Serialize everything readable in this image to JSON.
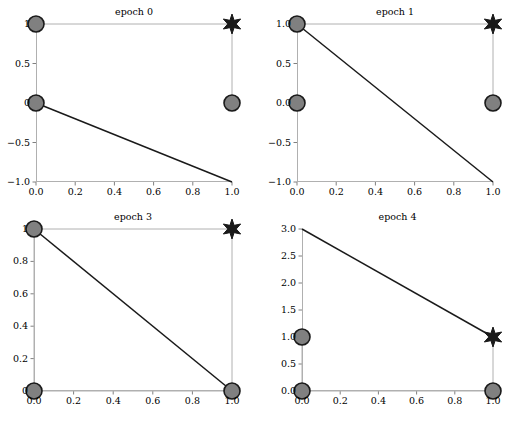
{
  "figure": {
    "width": 522,
    "height": 423,
    "background": "#ffffff",
    "rows": 2,
    "cols": 2
  },
  "style": {
    "marker_face_color": "#808080",
    "marker_edge_color": "#1a1a1a",
    "star_color": "#1a1a1a",
    "boundary_line_color": "#1a1a1a",
    "connector_line_color": "#b0b0b0",
    "axis_color": "#b0b0b0",
    "tick_color": "#808080",
    "text_color": "#000000"
  },
  "chart_data": [
    {
      "type": "scatter",
      "title": "epoch 0",
      "xlabel": "",
      "ylabel": "",
      "xlim": [
        0.0,
        1.0
      ],
      "ylim": [
        -1.0,
        1.0
      ],
      "grid": false,
      "legend": "none",
      "xticks": [
        "0.0",
        "0.2",
        "0.4",
        "0.6",
        "0.8",
        "1.0"
      ],
      "xtick_values": [
        0.0,
        0.2,
        0.4,
        0.6,
        0.8,
        1.0
      ],
      "yticks": [
        "1",
        "0.5",
        "0",
        "−0.5",
        "−1.0"
      ],
      "ytick_values": [
        1.0,
        0.5,
        0.0,
        -0.5,
        -1.0
      ],
      "series": [
        {
          "name": "circle-points",
          "marker": "circle",
          "x": [
            0.0,
            0.0,
            1.0
          ],
          "y": [
            1.0,
            0.0,
            0.0
          ]
        },
        {
          "name": "star-point",
          "marker": "star",
          "x": [
            1.0
          ],
          "y": [
            1.0
          ]
        },
        {
          "name": "connector-path",
          "marker": "line",
          "x": [
            0.0,
            1.0,
            1.0
          ],
          "y": [
            1.0,
            1.0,
            0.0
          ]
        },
        {
          "name": "decision-boundary",
          "marker": "line",
          "x": [
            0.0,
            1.0
          ],
          "y": [
            0.0,
            -1.0
          ]
        }
      ]
    },
    {
      "type": "scatter",
      "title": "epoch 1",
      "xlabel": "",
      "ylabel": "",
      "xlim": [
        0.0,
        1.0
      ],
      "ylim": [
        -1.0,
        1.0
      ],
      "grid": false,
      "legend": "none",
      "xticks": [
        "0.0",
        "0.2",
        "0.4",
        "0.6",
        "0.8",
        "1.0"
      ],
      "xtick_values": [
        0.0,
        0.2,
        0.4,
        0.6,
        0.8,
        1.0
      ],
      "yticks": [
        "1.0",
        "0.5",
        "0.0",
        "−0.5",
        "−1.0"
      ],
      "ytick_values": [
        1.0,
        0.5,
        0.0,
        -0.5,
        -1.0
      ],
      "series": [
        {
          "name": "circle-points",
          "marker": "circle",
          "x": [
            0.0,
            0.0,
            1.0
          ],
          "y": [
            1.0,
            0.0,
            0.0
          ]
        },
        {
          "name": "star-point",
          "marker": "star",
          "x": [
            1.0
          ],
          "y": [
            1.0
          ]
        },
        {
          "name": "connector-path",
          "marker": "line",
          "x": [
            0.0,
            1.0,
            1.0
          ],
          "y": [
            1.0,
            1.0,
            0.0
          ]
        },
        {
          "name": "decision-boundary",
          "marker": "line",
          "x": [
            0.0,
            1.0
          ],
          "y": [
            1.0,
            -1.0
          ]
        }
      ]
    },
    {
      "type": "scatter",
      "title": "epoch 3",
      "xlabel": "",
      "ylabel": "",
      "xlim": [
        0.0,
        1.0
      ],
      "ylim": [
        0.0,
        1.0
      ],
      "grid": false,
      "legend": "none",
      "xticks": [
        "0.0",
        "0.2",
        "0.4",
        "0.6",
        "0.8",
        "1.0"
      ],
      "xtick_values": [
        0.0,
        0.2,
        0.4,
        0.6,
        0.8,
        1.0
      ],
      "yticks": [
        "1",
        "0.8",
        "0.6",
        "0.4",
        "0.2",
        "0"
      ],
      "ytick_values": [
        1.0,
        0.8,
        0.6,
        0.4,
        0.2,
        0.0
      ],
      "series": [
        {
          "name": "circle-points",
          "marker": "circle",
          "x": [
            0.0,
            0.0,
            1.0
          ],
          "y": [
            1.0,
            0.0,
            0.0
          ]
        },
        {
          "name": "star-point",
          "marker": "star",
          "x": [
            1.0
          ],
          "y": [
            1.0
          ]
        },
        {
          "name": "connector-path",
          "marker": "line",
          "x": [
            0.0,
            1.0,
            1.0,
            0.0,
            0.0
          ],
          "y": [
            1.0,
            1.0,
            0.0,
            0.0,
            1.0
          ]
        },
        {
          "name": "decision-boundary",
          "marker": "line",
          "x": [
            0.0,
            1.0
          ],
          "y": [
            1.0,
            0.0
          ]
        }
      ]
    },
    {
      "type": "scatter",
      "title": "epoch 4",
      "xlabel": "",
      "ylabel": "",
      "xlim": [
        0.0,
        1.0
      ],
      "ylim": [
        0.0,
        3.0
      ],
      "grid": false,
      "legend": "none",
      "xticks": [
        "0.0",
        "0.2",
        "0.4",
        "0.6",
        "0.8",
        "1.0"
      ],
      "xtick_values": [
        0.0,
        0.2,
        0.4,
        0.6,
        0.8,
        1.0
      ],
      "yticks": [
        "3.0",
        "2.5",
        "2.0",
        "1.5",
        "1.0",
        "0.5",
        "0.0"
      ],
      "ytick_values": [
        3.0,
        2.5,
        2.0,
        1.5,
        1.0,
        0.5,
        0.0
      ],
      "series": [
        {
          "name": "circle-points",
          "marker": "circle",
          "x": [
            0.0,
            0.0,
            1.0
          ],
          "y": [
            1.0,
            0.0,
            0.0
          ]
        },
        {
          "name": "star-point",
          "marker": "star",
          "x": [
            1.0
          ],
          "y": [
            1.0
          ]
        },
        {
          "name": "connector-path",
          "marker": "line",
          "x": [
            0.0,
            0.0,
            1.0,
            1.0
          ],
          "y": [
            1.0,
            0.0,
            0.0,
            1.0
          ]
        },
        {
          "name": "decision-boundary",
          "marker": "line",
          "x": [
            0.0,
            1.0
          ],
          "y": [
            3.0,
            1.0
          ]
        }
      ]
    }
  ]
}
